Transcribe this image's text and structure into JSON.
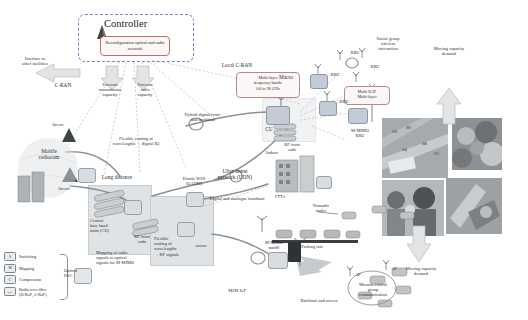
{
  "figure": {
    "domain": "network-architecture-diagram",
    "title_controller": "Controller",
    "controller_box": "Reconfiguration optical and radio network"
  },
  "labels": {
    "interface_other_facilities": "Interface to\nother facilities",
    "c_ran": "C-RAN",
    "forecast_transmission_capacity": "Forecast\ntransmission\ncapacity",
    "forecast_radio_capacity": "Forecast\nradio\ncapacity",
    "local_c_ran": "Local C-RAN",
    "multi_layer_bands": "Multi-layer\nfrequency bands:\n0.6 to 90 GHz",
    "macro": "Macro",
    "rru_1": "RRU",
    "rru_2": "RRU",
    "rru_3": "RRU",
    "rru_4": "RRU",
    "social_group": "Social group\nwireless\ninteraction",
    "multi_rat_multi_layer": "Multi RAT\nMulti-layer",
    "moving_capacity_demand_top": "Moving capacity\ndemand",
    "moving_capacity_demand_bottom": "Moving capacity\ndemand",
    "hybrid_digital": "Hybrid digital front-\nand backhaul",
    "cu": "CU",
    "rf_front_ends_right": "RF front\nends",
    "m_mimo_rru": "M-MIMO\nRRU",
    "server_top": "Server",
    "server_bottom": "Server",
    "mobile_radiocom": "Mobile\nradiocom",
    "flexible_routing_wavelengths": "Flexible routing of\nwavelengths → digital IQ",
    "long_distance": "Long distance",
    "elastic_wss": "Elastic WSS\n(OADM)",
    "ultra_dense_network": "Ultra dense\nnetwork (UDN)",
    "digital_analogue_fronthaul": "Digital and analogue fronthaul",
    "indoor": "Indoor",
    "fttx": "FTTx",
    "nomadic_nodes": "Nomadic\nnodes",
    "parking_lots": "Parking lots",
    "central_baseband": "Central\nbase band\nunits (CU)",
    "rf_front_ends_left": "RF front\nends",
    "flexible_routing_rf": "Flexible\nrouting of\nwavelengths\n→ RF signals",
    "mapping_radio_optical": "Mapping of radio\nsignals to optical\nsignals for M-MIMO",
    "m_mimo_mmw": "M-MIMO\nmmW",
    "m2m_iot": "M2M IoT",
    "backhaul_access": "Backhaul and access",
    "ap_1": "AP",
    "ap_2": "AP",
    "mission_critical": "Mission critical\ngroup\ncommunication",
    "optical_dsc": "Optical\nDSC"
  },
  "legend": {
    "items": [
      {
        "key": "S",
        "text": "Switching"
      },
      {
        "key": "M",
        "text": "Mapping"
      },
      {
        "key": "C",
        "text": "Compression"
      },
      {
        "key": "RoF",
        "text": "Radio over fiber\n(D-RoF, A-RoF)"
      }
    ],
    "callout": "Optical\nDSC"
  },
  "colors": {
    "controller_accent": "#c06a72",
    "dash_frame": "#7a86b8",
    "node_fill": "#d9dde2",
    "arrow_fill": "#e2e4e6",
    "text": "#2b2b2b",
    "fiber_line": "#8a9097"
  }
}
